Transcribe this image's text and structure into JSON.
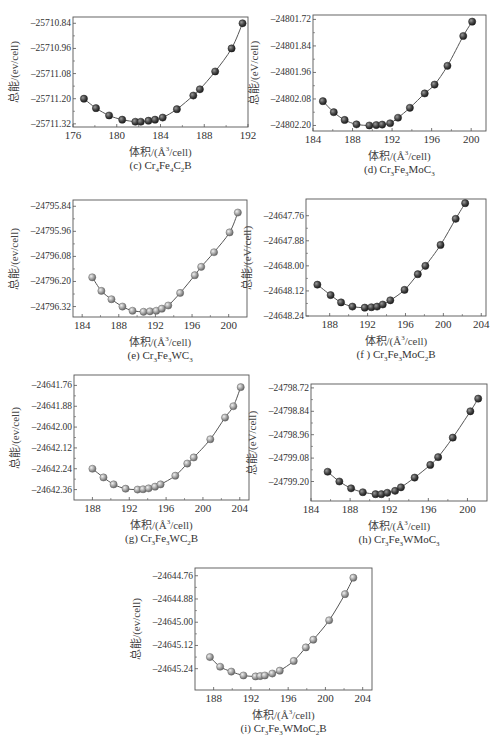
{
  "chart_data": [
    {
      "id": "c",
      "type": "scatter",
      "caption": "(c) Cr4Fe4C2B",
      "caption_parts": {
        "prefix": "(c) Cr",
        "s1": "4",
        "m1": "Fe",
        "s2": "4",
        "m2": "C",
        "s3": "2",
        "m3": "B",
        "s4": "",
        "m4": ""
      },
      "xlabel": "体积/(Å³/cell)",
      "ylabel": "总能/(ev/cell)",
      "xticks": [
        176,
        180,
        184,
        188,
        192
      ],
      "yticks": [
        -25710.84,
        -25710.96,
        -25711.08,
        -25711.2,
        -25711.32
      ],
      "ytick_labels": [
        "-25710.84",
        "-25710.96",
        "-25711.08",
        "-25711.20",
        "-25711.32"
      ],
      "xlim": [
        176,
        192
      ],
      "ylim": [
        -25711.335,
        -25710.81
      ],
      "marker": "dark",
      "x": [
        177.0,
        178.1,
        179.3,
        180.5,
        181.7,
        182.2,
        182.9,
        183.5,
        184.2,
        185.5,
        187.0,
        187.6,
        189.0,
        190.5,
        191.5
      ],
      "y": [
        -25711.2,
        -25711.245,
        -25711.28,
        -25711.3,
        -25711.31,
        -25711.31,
        -25711.305,
        -25711.3,
        -25711.29,
        -25711.25,
        -25711.185,
        -25711.155,
        -25711.07,
        -25710.96,
        -25710.84
      ]
    },
    {
      "id": "d",
      "type": "scatter",
      "caption": "(d) Cr3Fe3MoC3",
      "caption_parts": {
        "prefix": "(d) Cr",
        "s1": "3",
        "m1": "Fe",
        "s2": "3",
        "m2": "MoC",
        "s3": "3",
        "m3": "",
        "s4": "",
        "m4": ""
      },
      "xlabel": "体积/(Å³/cell)",
      "ylabel": "总能/(eV/cell)",
      "xticks": [
        184,
        188,
        192,
        196,
        200
      ],
      "yticks": [
        -24801.72,
        -24801.84,
        -24801.96,
        -24802.08,
        -24802.2
      ],
      "ytick_labels": [
        "-24801.72",
        "-24801.84",
        "-24801.96",
        "-24802.08",
        "-24802.20"
      ],
      "xlim": [
        184,
        201.5
      ],
      "ylim": [
        -24802.225,
        -24801.7
      ],
      "marker": "dark",
      "x": [
        185.0,
        186.1,
        187.2,
        188.4,
        189.7,
        190.4,
        191.0,
        191.8,
        192.6,
        193.8,
        195.3,
        196.3,
        197.6,
        199.2,
        200.1
      ],
      "y": [
        -24802.09,
        -24802.14,
        -24802.175,
        -24802.195,
        -24802.2,
        -24802.198,
        -24802.196,
        -24802.19,
        -24802.165,
        -24802.12,
        -24802.055,
        -24802.015,
        -24801.93,
        -24801.795,
        -24801.73
      ]
    },
    {
      "id": "e",
      "type": "scatter",
      "caption": "(e) Cr3Fe3WC3",
      "caption_parts": {
        "prefix": "(e) Cr",
        "s1": "3",
        "m1": "Fe",
        "s2": "3",
        "m2": "WC",
        "s3": "3",
        "m3": "",
        "s4": "",
        "m4": ""
      },
      "xlabel": "体积/(Å³/cell)",
      "ylabel": "总能/(ev/cell)",
      "xticks": [
        184,
        188,
        192,
        196,
        200
      ],
      "yticks": [
        -24795.84,
        -24795.96,
        -24796.08,
        -24796.2,
        -24796.32
      ],
      "ytick_labels": [
        "-24795.84",
        "-24795.96",
        "-24796.08",
        "-24796.20",
        "-24796.32"
      ],
      "xlim": [
        183,
        202
      ],
      "ylim": [
        -24796.37,
        -24795.81
      ],
      "marker": "light",
      "x": [
        185.1,
        186.1,
        187.2,
        188.4,
        189.5,
        190.7,
        191.4,
        192.1,
        192.7,
        193.4,
        194.7,
        196.3,
        197.0,
        198.4,
        200.1,
        201.0
      ],
      "y": [
        -24796.18,
        -24796.245,
        -24796.285,
        -24796.32,
        -24796.34,
        -24796.345,
        -24796.343,
        -24796.34,
        -24796.33,
        -24796.315,
        -24796.255,
        -24796.17,
        -24796.13,
        -24796.06,
        -24795.965,
        -24795.87
      ]
    },
    {
      "id": "f",
      "type": "scatter",
      "caption": "(f) Cr3Fe3MoC2B",
      "caption_parts": {
        "prefix": "(f ) Cr",
        "s1": "3",
        "m1": "Fe",
        "s2": "3",
        "m2": "MoC",
        "s3": "2",
        "m3": "B",
        "s4": "",
        "m4": ""
      },
      "xlabel": "体积/(Å³/cell)",
      "ylabel": "总能/(eV/cell)",
      "xticks": [
        188,
        192,
        196,
        200,
        204
      ],
      "yticks": [
        -24647.76,
        -24647.88,
        -24648.0,
        -24648.12,
        -24648.24
      ],
      "ytick_labels": [
        "-24647.76",
        "-24647.88",
        "-24648.00",
        "-24648.12",
        "-24648.24"
      ],
      "xlim": [
        185.5,
        204.5
      ],
      "ylim": [
        -24648.24,
        -24647.68
      ],
      "marker": "dark",
      "x": [
        186.7,
        188.1,
        189.2,
        190.4,
        191.7,
        192.4,
        193.0,
        193.6,
        194.4,
        195.9,
        197.3,
        198.1,
        199.7,
        201.3,
        202.3
      ],
      "y": [
        -24648.09,
        -24648.14,
        -24648.175,
        -24648.195,
        -24648.2,
        -24648.198,
        -24648.195,
        -24648.185,
        -24648.165,
        -24648.115,
        -24648.04,
        -24648.0,
        -24647.9,
        -24647.775,
        -24647.7
      ]
    },
    {
      "id": "g",
      "type": "scatter",
      "caption": "(g) Cr3Fe3WC2B",
      "caption_parts": {
        "prefix": "(g) Cr",
        "s1": "3",
        "m1": "Fe",
        "s2": "3",
        "m2": "WC",
        "s3": "2",
        "m3": "B",
        "s4": "",
        "m4": ""
      },
      "xlabel": "体积/(Å³/cell)",
      "ylabel": "总能/(ev/cell)",
      "xticks": [
        188,
        192,
        196,
        200,
        204
      ],
      "yticks": [
        -24641.76,
        -24641.88,
        -24642.0,
        -24642.12,
        -24642.24,
        -24642.36
      ],
      "ytick_labels": [
        "-24641.76",
        "-24641.88",
        "-24642.00",
        "-24642.12",
        "-24642.24",
        "-24642.36"
      ],
      "xlim": [
        186,
        205
      ],
      "ylim": [
        -24642.42,
        -24641.7
      ],
      "marker": "light",
      "x": [
        188.0,
        189.2,
        190.3,
        191.6,
        192.9,
        193.5,
        194.1,
        194.8,
        195.4,
        197.0,
        198.3,
        199.0,
        200.8,
        202.4,
        203.3,
        204.1
      ],
      "y": [
        -24642.24,
        -24642.29,
        -24642.33,
        -24642.355,
        -24642.36,
        -24642.358,
        -24642.353,
        -24642.343,
        -24642.33,
        -24642.28,
        -24642.21,
        -24642.175,
        -24642.07,
        -24641.945,
        -24641.88,
        -24641.77
      ]
    },
    {
      "id": "h",
      "type": "scatter",
      "caption": "(h) Cr3Fe3WMoC3",
      "caption_parts": {
        "prefix": "(h) Cr",
        "s1": "3",
        "m1": "Fe",
        "s2": "3",
        "m2": "WMoC",
        "s3": "3",
        "m3": "",
        "s4": "",
        "m4": ""
      },
      "xlabel": "体积/(Å³/cell)",
      "ylabel": "总能/(eV/cell)",
      "xticks": [
        184,
        188,
        192,
        196,
        200
      ],
      "yticks": [
        -24798.72,
        -24798.84,
        -24798.96,
        -24799.08,
        -24799.2
      ],
      "ytick_labels": [
        "-24798.72",
        "-24798.84",
        "-24798.96",
        "-24799.08",
        "-24799.20"
      ],
      "xlim": [
        184,
        202
      ],
      "ylim": [
        -24799.3,
        -24798.7
      ],
      "marker": "dark",
      "x": [
        185.7,
        186.9,
        188.1,
        189.3,
        190.6,
        191.2,
        191.8,
        192.6,
        193.2,
        194.6,
        196.2,
        197.0,
        198.5,
        200.3,
        201.1
      ],
      "y": [
        -24799.15,
        -24799.2,
        -24799.235,
        -24799.255,
        -24799.265,
        -24799.265,
        -24799.258,
        -24799.248,
        -24799.23,
        -24799.18,
        -24799.115,
        -24799.075,
        -24798.975,
        -24798.84,
        -24798.775
      ]
    },
    {
      "id": "i",
      "type": "scatter",
      "caption": "(i) Cr3Fe3WMoC2B",
      "caption_parts": {
        "prefix": "(i) Cr",
        "s1": "3",
        "m1": "Fe",
        "s2": "3",
        "m2": "WMoC",
        "s3": "2",
        "m3": "B",
        "s4": "",
        "m4": ""
      },
      "xlabel": "体积/(Å³/cell)",
      "ylabel": "总能/(ev/cell)",
      "xticks": [
        188,
        192,
        196,
        200,
        204
      ],
      "yticks": [
        -24644.76,
        -24644.88,
        -24645.0,
        -24645.12,
        -24645.24
      ],
      "ytick_labels": [
        "-24644.76",
        "-24644.88",
        "-24645.00",
        "-24645.12",
        "-24645.24"
      ],
      "xlim": [
        186,
        205
      ],
      "ylim": [
        -24645.35,
        -24644.72
      ],
      "marker": "light",
      "x": [
        187.6,
        188.7,
        189.9,
        191.2,
        192.5,
        193.0,
        193.5,
        194.3,
        195.1,
        196.6,
        197.9,
        198.7,
        200.4,
        202.1,
        203.0
      ],
      "y": [
        -24645.18,
        -24645.23,
        -24645.255,
        -24645.275,
        -24645.28,
        -24645.278,
        -24645.275,
        -24645.265,
        -24645.25,
        -24645.2,
        -24645.13,
        -24645.09,
        -24644.99,
        -24644.855,
        -24644.77
      ]
    }
  ]
}
